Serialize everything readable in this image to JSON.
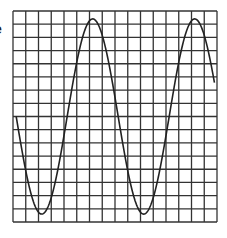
{
  "edge_text": "e",
  "chart_data": {
    "type": "line",
    "title": "",
    "xlabel": "",
    "ylabel": "",
    "grid": true,
    "grid_columns": 16,
    "grid_rows": 16,
    "xlim": [
      0,
      16
    ],
    "ylim": [
      -8,
      8
    ],
    "series": [
      {
        "name": "sine-wave",
        "function": "y = -A * sin(2*pi*(x - x0)/T)",
        "amplitude": 7.4,
        "period": 8,
        "x_start": 0.25,
        "x_end": 15.8,
        "phase_x0": 0.25,
        "peaks_x": [
          6.25,
          14.25
        ],
        "troughs_x": [
          2.25,
          10.25
        ]
      }
    ],
    "colors": {
      "grid": "#333333",
      "curve": "#222222",
      "background": "#ffffff"
    }
  }
}
